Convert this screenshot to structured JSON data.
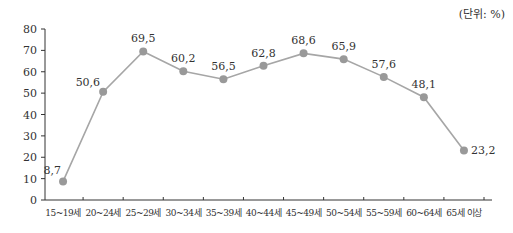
{
  "unit_label": "(단위: %)",
  "colors": {
    "line": "#a6a6a6",
    "marker": "#999999",
    "axis": "#333333",
    "text": "#333333"
  },
  "chart_data": {
    "type": "line",
    "title": "",
    "unit": "(단위: %)",
    "xlabel": "",
    "ylabel": "",
    "categories": [
      "15~19세",
      "20~24세",
      "25~29세",
      "30~34세",
      "35~39세",
      "40~44세",
      "45~49세",
      "50~54세",
      "55~59세",
      "60~64세",
      "65세 이상"
    ],
    "series": [
      {
        "name": "",
        "values": [
          8.7,
          50.6,
          69.5,
          60.2,
          56.5,
          62.8,
          68.6,
          65.9,
          57.6,
          48.1,
          23.2
        ]
      }
    ],
    "data_labels": [
      "8,7",
      "50,6",
      "69,5",
      "60,2",
      "56,5",
      "62,8",
      "68,6",
      "65,9",
      "57,6",
      "48,1",
      "23,2"
    ],
    "ylim": [
      0,
      80
    ],
    "yticks": [
      0,
      10,
      20,
      30,
      40,
      50,
      60,
      70,
      80
    ],
    "grid": false,
    "legend": null
  }
}
